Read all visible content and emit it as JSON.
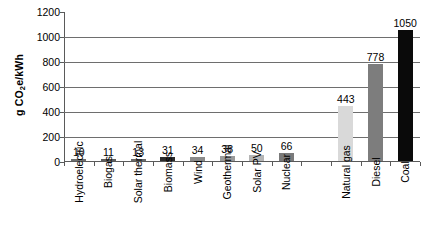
{
  "chart_data": {
    "type": "bar",
    "title": "",
    "xlabel": "",
    "ylabel": "g CO2e/kWh",
    "ylabel_parts": {
      "prefix": "g CO",
      "sub": "2",
      "suffix": "e/kWh"
    },
    "ylim": [
      0,
      1200
    ],
    "ytick_values": [
      0,
      200,
      400,
      600,
      800,
      1000,
      1200
    ],
    "ytick_labels": [
      "0",
      "200",
      "400",
      "600",
      "800",
      "1000",
      "1200"
    ],
    "gridline_values": [
      200,
      400,
      600,
      800,
      1000
    ],
    "grid": true,
    "legend": "none",
    "categories": [
      "Hydroelectric",
      "Biogas",
      "Solar thermal",
      "Biomass",
      "Wind",
      "Geothermal",
      "Solar PV",
      "Nuclear",
      "Natural gas",
      "Diesel",
      "Coal"
    ],
    "values": [
      10,
      11,
      13,
      31,
      34,
      38,
      50,
      66,
      443,
      778,
      1050
    ],
    "value_labels": [
      "10",
      "11",
      "13",
      "31",
      "34",
      "38",
      "50",
      "66",
      "443",
      "778",
      "1050"
    ],
    "bar_colors": [
      "#6e6e6e",
      "#5e5e5e",
      "#6a6a6a",
      "#2b2b2b",
      "#8a8a8a",
      "#9a9a9a",
      "#b5b5b5",
      "#7a7a7a",
      "#d9d9d9",
      "#7d7d7d",
      "#0a0a0a"
    ],
    "slots": 12,
    "empty_slot_index": 8
  },
  "colors": {
    "axis": "#5a5a5a",
    "gridline": "#6e6e6e",
    "text": "#000000",
    "background": "#ffffff"
  }
}
